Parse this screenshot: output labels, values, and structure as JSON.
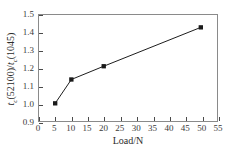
{
  "chart_data": {
    "type": "line",
    "title": "",
    "subtitle": "",
    "xlabel": "Load/N",
    "ylabel": "t_c(52100)/t_c(1045)",
    "ylabel_parts": {
      "var1": "t",
      "sub1": "c",
      "paren1": "(52100)/",
      "var2": "t",
      "sub2": "c",
      "paren2": "(1045)"
    },
    "x": [
      5,
      10,
      20,
      50
    ],
    "values": [
      1.0,
      1.135,
      1.21,
      1.43
    ],
    "series": [
      {
        "name": "tc ratio",
        "x": [
          5,
          10,
          20,
          50
        ],
        "values": [
          1.0,
          1.135,
          1.21,
          1.43
        ],
        "marker": "square",
        "marker_color": "#1a1a1a",
        "line_color": "#1a1a1a"
      }
    ],
    "xlim": [
      0,
      55
    ],
    "ylim": [
      0.9,
      1.5
    ],
    "xticks": [
      0,
      5,
      10,
      15,
      20,
      25,
      30,
      35,
      40,
      45,
      50,
      55
    ],
    "xticklabels": [
      "0",
      "5",
      "10",
      "15",
      "20",
      "25",
      "30",
      "35",
      "40",
      "45",
      "50",
      "55"
    ],
    "yticks": [
      0.9,
      1.0,
      1.1,
      1.2,
      1.3,
      1.4,
      1.5
    ],
    "yticklabels": [
      "0.9",
      "1.0",
      "1.1",
      "1.2",
      "1.3",
      "1.4",
      "1.5"
    ],
    "grid": false,
    "legend": null,
    "legend_position": "none",
    "tick_direction": "in",
    "frame_color": "#8a8a8a",
    "background_color": "#ffffff"
  }
}
